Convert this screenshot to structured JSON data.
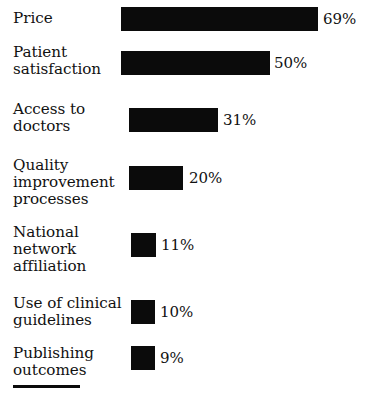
{
  "chart_data": {
    "type": "bar",
    "orientation": "horizontal",
    "title": "",
    "subtitle": "",
    "xlabel": "",
    "ylabel": "",
    "categories": [
      "Price",
      "Patient satisfaction",
      "Access to doctors",
      "Quality improvement processes",
      "National network affiliation",
      "Use of clinical guidelines",
      "Publishing outcomes"
    ],
    "values": [
      69,
      50,
      31,
      20,
      11,
      10,
      9
    ],
    "value_labels": [
      "69%",
      "50%",
      "31%",
      "20%",
      "11%",
      "10%",
      "9%"
    ],
    "unit": "%",
    "xlim": [
      0,
      69
    ],
    "grid": false,
    "legend": false,
    "bar_color": "#0b0b0b",
    "background_color": "#ffffff"
  },
  "rows": [
    {
      "label": "Price",
      "value": 69,
      "value_label": "69%",
      "label_lines": [
        "Price"
      ],
      "label_top": 10,
      "bar_left": 121,
      "bar_top": 7,
      "bar_width": 197,
      "value_left": 323
    },
    {
      "label": "Patient satisfaction",
      "value": 50,
      "value_label": "50%",
      "label_lines": [
        "Patient",
        "satisfaction"
      ],
      "label_top": 44,
      "bar_top": 51,
      "bar_left": 121,
      "bar_width": 149,
      "value_left": 274
    },
    {
      "label": "Access to doctors",
      "value": 31,
      "value_label": "31%",
      "label_lines": [
        "Access to",
        "doctors"
      ],
      "label_top": 101,
      "bar_top": 108,
      "bar_left": 129,
      "bar_width": 89,
      "value_left": 223
    },
    {
      "label": "Quality improvement processes",
      "value": 20,
      "value_label": "20%",
      "label_lines": [
        "Quality",
        "improvement",
        "processes"
      ],
      "label_top": 157,
      "bar_top": 166,
      "bar_left": 129,
      "bar_width": 54,
      "value_left": 189
    },
    {
      "label": "National network affiliation",
      "value": 11,
      "value_label": "11%",
      "label_lines": [
        "National",
        "network",
        "affiliation"
      ],
      "label_top": 224,
      "bar_top": 233,
      "bar_left": 131,
      "bar_width": 25,
      "value_left": 161
    },
    {
      "label": "Use of clinical guidelines",
      "value": 10,
      "value_label": "10%",
      "label_lines": [
        "Use of clinical",
        "guidelines"
      ],
      "label_top": 295,
      "bar_top": 300,
      "bar_left": 131,
      "bar_width": 24,
      "value_left": 160
    },
    {
      "label": "Publishing outcomes",
      "value": 9,
      "value_label": "9%",
      "label_lines": [
        "Publishing",
        "outcomes"
      ],
      "label_top": 345,
      "bar_top": 346,
      "bar_left": 131,
      "bar_width": 24,
      "value_left": 160
    }
  ]
}
